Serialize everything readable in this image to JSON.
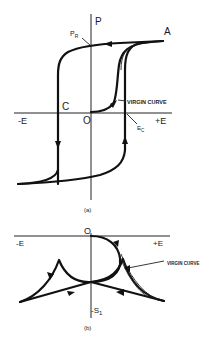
{
  "figure_a": {
    "caption": "(a)",
    "axis_y_label": "P",
    "axis_x_neg": "-E",
    "axis_x_pos": "+E",
    "origin": "O",
    "point_A": "A",
    "point_C": "C",
    "remanent_label": "P",
    "remanent_sub": "R",
    "coercive_label": "E",
    "coercive_sub": "C",
    "virgin_label": "VIRGIN CURVE"
  },
  "figure_b": {
    "caption": "(b)",
    "axis_x_neg": "-E",
    "axis_x_pos": "+E",
    "origin": "O",
    "axis_y_neg": "-S",
    "axis_y_neg_sub": "1",
    "virgin_label": "VIRGIN CURVE"
  },
  "colors": {
    "ink": "#111111",
    "background": "#ffffff"
  }
}
